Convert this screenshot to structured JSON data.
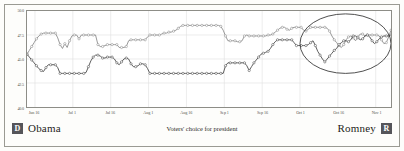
{
  "figure": {
    "caption": "Voters' choice for president"
  },
  "legend": {
    "left": {
      "badge": "D",
      "name": "Obama",
      "badge_color": "#55555a"
    },
    "right": {
      "badge": "R",
      "name": "Romney",
      "badge_color": "#55555a"
    }
  },
  "colors": {
    "obama_line": "#8c8c8c",
    "romney_line": "#4a4a4a",
    "marker_fill": "#ffffff",
    "gridline": "#dedede",
    "frame": "#8d8d87",
    "annotation_ellipse": "#3a3a3a",
    "background": "#fdfdfb",
    "axis_text": "#55554f"
  },
  "annotations": [
    {
      "name": "convergence-ellipse",
      "shape": "ellipse",
      "cx_fraction": 0.875,
      "cy_value": 46.6,
      "rx_fraction": 0.125,
      "ry_value": 3.1
    }
  ],
  "chart_data": {
    "type": "line",
    "title": "",
    "subtitle": "",
    "xlabel": "",
    "ylabel": "",
    "ylim": [
      40.0,
      50.0
    ],
    "ytick_values": [
      40.0,
      42.5,
      45.0,
      47.5,
      50.0
    ],
    "ytick_labels": [
      "40.0",
      "42.5",
      "45.0",
      "47.5",
      "50.0"
    ],
    "grid": true,
    "legend_position": "bottom",
    "xtick_labels": [
      "Jun 16",
      "Jul 1",
      "Jul 16",
      "Aug 1",
      "Aug 16",
      "Sep 1",
      "Sep 16",
      "Oct 1",
      "Oct 16",
      "Nov 1"
    ],
    "xtick_positions": [
      0.022,
      0.126,
      0.23,
      0.334,
      0.438,
      0.542,
      0.646,
      0.75,
      0.854,
      0.958
    ],
    "x_count": 145,
    "series": [
      {
        "name": "Obama",
        "color": "#8c8c8c",
        "marker": "circle-open",
        "values": [
          45.5,
          45.9,
          46.3,
          46.7,
          47.1,
          47.4,
          47.6,
          47.7,
          47.7,
          47.7,
          47.7,
          47.7,
          47.7,
          47.2,
          46.5,
          46.1,
          46.6,
          46.2,
          46.9,
          47.4,
          47.5,
          47.5,
          47.1,
          47.5,
          47.5,
          47.5,
          47.5,
          47.5,
          47.5,
          47.5,
          46.5,
          46.3,
          46.3,
          46.4,
          46.5,
          46.5,
          46.5,
          46.5,
          46.5,
          46.2,
          46.2,
          46.2,
          46.3,
          46.9,
          47.0,
          47.0,
          47.0,
          47.0,
          47.0,
          47.0,
          47.0,
          47.3,
          47.5,
          47.5,
          47.5,
          47.5,
          47.5,
          47.6,
          47.7,
          47.7,
          47.8,
          47.8,
          47.9,
          48.0,
          48.2,
          48.4,
          48.5,
          48.5,
          48.5,
          48.5,
          48.5,
          48.5,
          48.5,
          48.5,
          48.5,
          48.5,
          48.5,
          48.5,
          48.5,
          48.5,
          48.5,
          48.5,
          48.4,
          48.0,
          47.4,
          46.9,
          46.9,
          46.9,
          46.9,
          46.8,
          46.8,
          46.9,
          47.4,
          47.5,
          47.4,
          47.4,
          47.4,
          47.4,
          47.4,
          47.4,
          47.4,
          47.4,
          47.5,
          47.5,
          47.6,
          47.8,
          48.0,
          48.2,
          48.3,
          48.3,
          48.1,
          48.0,
          48.2,
          48.3,
          48.3,
          48.3,
          48.3,
          48.0,
          47.9,
          48.1,
          48.3,
          48.3,
          48.3,
          48.3,
          48.3,
          48.3,
          48.3,
          48.2,
          47.9,
          47.4,
          47.0,
          46.7,
          46.4,
          46.2,
          46.5,
          47.0,
          47.3,
          47.4,
          47.2,
          46.9,
          47.3,
          47.6,
          47.6,
          47.4,
          47.5,
          47.5,
          47.5,
          47.5,
          47.5,
          47.4,
          47.0,
          46.6,
          46.7,
          47.3,
          48.0
        ]
      },
      {
        "name": "Romney",
        "color": "#4a4a4a",
        "marker": "circle-open",
        "values": [
          45.5,
          45.2,
          44.9,
          44.6,
          44.3,
          44.0,
          43.8,
          43.7,
          44.1,
          44.4,
          44.4,
          44.4,
          44.4,
          44.1,
          43.5,
          43.5,
          43.5,
          43.5,
          43.5,
          43.5,
          43.5,
          43.5,
          43.5,
          43.5,
          43.5,
          43.6,
          44.2,
          44.8,
          45.2,
          45.4,
          45.4,
          45.3,
          45.1,
          45.1,
          45.2,
          45.2,
          45.2,
          45.0,
          44.6,
          44.4,
          44.7,
          45.0,
          45.1,
          45.0,
          44.5,
          44.2,
          44.2,
          44.3,
          44.5,
          44.5,
          44.4,
          44.0,
          43.5,
          43.5,
          43.5,
          43.5,
          43.5,
          43.5,
          43.5,
          43.5,
          43.5,
          43.5,
          43.5,
          43.5,
          43.5,
          43.5,
          43.5,
          43.5,
          43.5,
          43.5,
          43.5,
          43.5,
          43.5,
          43.5,
          43.5,
          43.5,
          43.5,
          43.5,
          43.5,
          43.5,
          43.5,
          43.5,
          43.5,
          43.5,
          44.3,
          44.6,
          44.6,
          44.6,
          44.6,
          44.6,
          44.6,
          44.6,
          44.6,
          44.3,
          43.8,
          44.2,
          44.6,
          44.9,
          45.2,
          45.5,
          45.6,
          45.7,
          45.8,
          46.1,
          46.5,
          46.8,
          47.0,
          47.0,
          47.0,
          47.0,
          47.0,
          47.0,
          47.0,
          46.7,
          46.4,
          46.4,
          46.4,
          46.4,
          46.4,
          46.5,
          46.7,
          46.9,
          46.4,
          45.8,
          45.4,
          45.0,
          44.7,
          45.0,
          45.3,
          45.6,
          45.9,
          46.1,
          46.5,
          46.7,
          46.9,
          46.9,
          46.8,
          47.0,
          47.4,
          47.4,
          47.2,
          47.0,
          47.1,
          47.4,
          47.5,
          47.3,
          46.9,
          46.6,
          46.8,
          47.1,
          47.3,
          47.4,
          47.4,
          47.4,
          47.5
        ]
      }
    ]
  }
}
